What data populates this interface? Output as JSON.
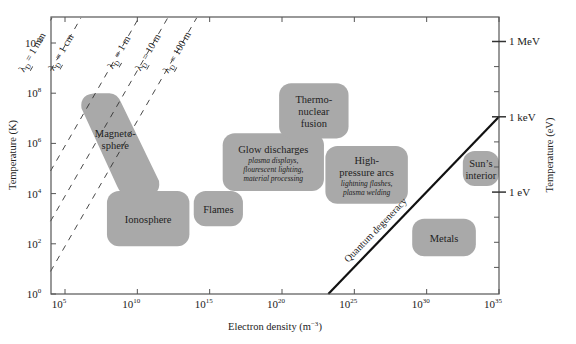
{
  "chart_data": {
    "type": "diagram",
    "title": "",
    "xlabel": "Electron density (m",
    "xlabel_sup": "−3",
    "xlabel_end": ")",
    "ylabel_left": "Temperature (K)",
    "ylabel_right": "Temperature (eV)",
    "x_scale": "log",
    "y_scale": "log",
    "xlim_exp": [
      4,
      35
    ],
    "ylim_exp": [
      0,
      11
    ],
    "x_ticks": [
      {
        "exp": 5,
        "base": "10",
        "sup": "5"
      },
      {
        "exp": 10,
        "base": "10",
        "sup": "10"
      },
      {
        "exp": 15,
        "base": "10",
        "sup": "15"
      },
      {
        "exp": 20,
        "base": "10",
        "sup": "20"
      },
      {
        "exp": 25,
        "base": "10",
        "sup": "25"
      },
      {
        "exp": 30,
        "base": "10",
        "sup": "30"
      },
      {
        "exp": 35,
        "base": "10",
        "sup": "35"
      }
    ],
    "y_ticks": [
      {
        "exp": 0,
        "base": "10",
        "sup": "0"
      },
      {
        "exp": 2,
        "base": "10",
        "sup": "2"
      },
      {
        "exp": 4,
        "base": "10",
        "sup": "4"
      },
      {
        "exp": 6,
        "base": "10",
        "sup": "6"
      },
      {
        "exp": 8,
        "base": "10",
        "sup": "8"
      },
      {
        "exp": 10,
        "base": "10",
        "sup": "10"
      }
    ],
    "y_right_ticks": [
      {
        "exp_K": 10.06,
        "label": "1 MeV"
      },
      {
        "exp_K": 7.06,
        "label": "1 keV"
      },
      {
        "exp_K": 4.06,
        "label": "1 eV"
      }
    ],
    "y_right_minor_exp_K": [
      9.06,
      8.06,
      6.06,
      5.06,
      3.06,
      2.06,
      1.06
    ],
    "debye_lines": [
      {
        "lambda": "λ",
        "sub": "D",
        "value": " = 100 m",
        "x0_exp": 4.1,
        "slope_dec_per_dec": 1.0,
        "offset": -3.1
      },
      {
        "lambda": "λ",
        "sub": "D",
        "value": " = 10 m",
        "x0_exp": 4.1,
        "offset": -1.1
      },
      {
        "lambda": "λ",
        "sub": "D",
        "value": " = 1 m",
        "x0_exp": 4.1,
        "offset": 0.9
      },
      {
        "lambda": "λ",
        "sub": "D",
        "value": " = 1 cm",
        "x0_exp": 4.1,
        "offset": 4.9
      },
      {
        "lambda": "λ",
        "sub": "D",
        "value": " = 1 mm",
        "x0_exp": 4.1,
        "offset": 6.9
      },
      {
        "lambda": "λ",
        "sub": "D",
        "value": " = 1 μm",
        "x0_exp": 4.1,
        "offset": 12.9
      }
    ],
    "quantum_degeneracy": {
      "label": "Quantum degeneracy",
      "start": {
        "x_exp": 23.2,
        "y_exp": 0
      },
      "end": {
        "x_exp": 35,
        "y_exp": 7.06
      }
    },
    "regions": [
      {
        "name": "Magnetosphere",
        "lines": [
          "Magneto-",
          "sphere"
        ],
        "sub": [],
        "shape": "slanted",
        "x_exp": [
          6,
          11.5
        ],
        "y_exp": [
          3.9,
          8.0
        ]
      },
      {
        "name": "Ionosphere",
        "lines": [
          "Ionosphere"
        ],
        "sub": [],
        "x_exp": [
          7.9,
          13.6
        ],
        "y_exp": [
          1.9,
          4.1
        ]
      },
      {
        "name": "Flames",
        "lines": [
          "Flames"
        ],
        "sub": [],
        "x_exp": [
          13.9,
          17.3
        ],
        "y_exp": [
          2.7,
          4.1
        ]
      },
      {
        "name": "Glow discharges",
        "lines": [
          "Glow discharges"
        ],
        "sub": [
          "plasma displays,",
          "flourescent lighting,",
          "material processing"
        ],
        "x_exp": [
          15.9,
          22.9
        ],
        "y_exp": [
          4.1,
          6.4
        ]
      },
      {
        "name": "Thermonuclear fusion",
        "lines": [
          "Thermo-",
          "nuclear",
          "fusion"
        ],
        "sub": [],
        "x_exp": [
          19.8,
          24.6
        ],
        "y_exp": [
          6.2,
          8.4
        ]
      },
      {
        "name": "High-pressure arcs",
        "lines": [
          "High-",
          "pressure arcs"
        ],
        "sub": [
          "lightning flashes,",
          "plasma welding"
        ],
        "x_exp": [
          23.0,
          28.7
        ],
        "y_exp": [
          3.6,
          5.9
        ]
      },
      {
        "name": "Metals",
        "lines": [
          "Metals"
        ],
        "sub": [],
        "x_exp": [
          29.0,
          33.4
        ],
        "y_exp": [
          1.5,
          3.0
        ]
      },
      {
        "name": "Sun's interior",
        "lines": [
          "Sun’s",
          "interior"
        ],
        "sub": [],
        "x_exp": [
          32.5,
          35.0
        ],
        "y_exp": [
          4.3,
          5.7
        ]
      }
    ]
  }
}
